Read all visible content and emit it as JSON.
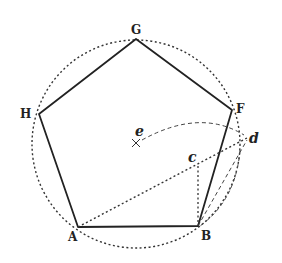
{
  "diagram": {
    "type": "geometric-construction",
    "colors": {
      "ink": "#222222",
      "background": "#ffffff"
    },
    "circle": {
      "cx": 136,
      "cy": 144,
      "r": 104,
      "style": "dotted"
    },
    "vertices": {
      "A": {
        "label": "A",
        "x": 78,
        "y": 227
      },
      "B": {
        "label": "B",
        "x": 198,
        "y": 226
      },
      "F": {
        "label": "F",
        "x": 232,
        "y": 110
      },
      "G": {
        "label": "G",
        "x": 136,
        "y": 39
      },
      "H": {
        "label": "H",
        "x": 39,
        "y": 114
      }
    },
    "points": {
      "e": {
        "label": "e",
        "x": 136,
        "y": 143,
        "marker": "x"
      },
      "c": {
        "label": "c",
        "x": 198,
        "y": 166
      },
      "d": {
        "label": "d",
        "x": 247,
        "y": 138
      }
    },
    "construction_lines": [
      {
        "from": "A",
        "to": "d",
        "style": "dotted"
      },
      {
        "from": "c",
        "to": "B",
        "style": "dotted"
      },
      {
        "from": "B",
        "to": "d",
        "style": "dashed"
      },
      {
        "arc": "e to d",
        "style": "dashed"
      },
      {
        "arc": "d to B",
        "style": "dashed"
      }
    ]
  }
}
